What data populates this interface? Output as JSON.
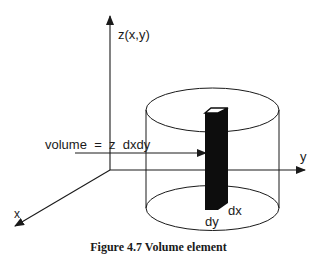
{
  "figure": {
    "labels": {
      "z_axis": "z(x,y)",
      "y_axis": "y",
      "x_axis": "x",
      "volume_formula": "volume  =  z  dxdy",
      "dx": "dx",
      "dy": "dy"
    },
    "caption": "Figure 4.7  Volume element",
    "colors": {
      "line": "#1a1a1a",
      "column_fill": "#0d0d0d",
      "column_top": "#ffffff",
      "background": "#ffffff"
    }
  }
}
